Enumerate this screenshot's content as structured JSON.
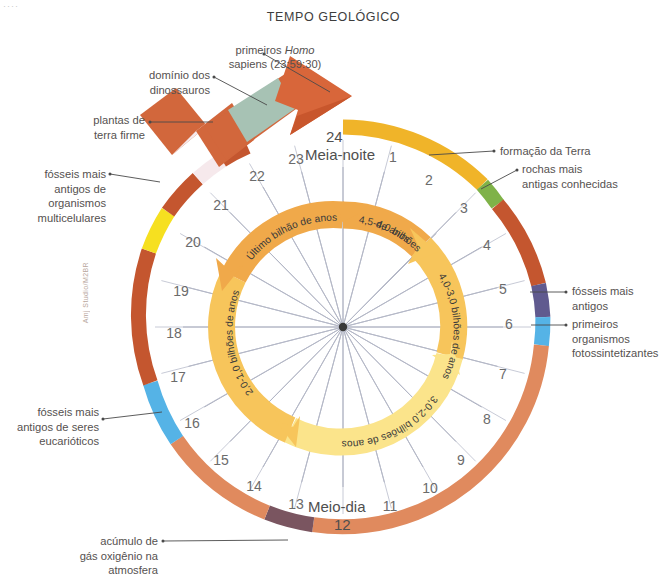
{
  "page": {
    "title": "TEMPO GEOLÓGICO",
    "corner_marks": "····",
    "credit": "Amj Studio/M2BR"
  },
  "colors": {
    "background": "#ffffff",
    "outer_gold": "#f0b429",
    "outer_green": "#7fb248",
    "outer_terracotta": "#c4562f",
    "outer_salmon": "#e08a5e",
    "outer_purple": "#605a8f",
    "outer_skyblue": "#55b3e6",
    "outer_mauve": "#7a5560",
    "outer_yellow": "#f6e020",
    "outer_pale_pink": "#f6e9ec",
    "arrow_sage": "#a7c2b4",
    "inner_pale_yellow": "#fbe48b",
    "inner_gold": "#f7c55b",
    "inner_orange": "#f0a94a",
    "spoke": "#8f93a8",
    "leader": "#4a4a4a",
    "text": "#55514f"
  },
  "clock": {
    "midnight_label": "Meia-noite",
    "midnight_number": "24",
    "noon_label": "Meio-dia",
    "noon_number": "12",
    "hours": [
      "1",
      "2",
      "3",
      "4",
      "5",
      "6",
      "7",
      "8",
      "9",
      "10",
      "11",
      "13",
      "14",
      "15",
      "16",
      "17",
      "18",
      "19",
      "20",
      "21",
      "22",
      "23"
    ]
  },
  "inner_ring_segments": [
    {
      "name": "eon-4.5-4.0",
      "label": "4,5-4,0 bilhões\nde anos",
      "color": "#f0a94a"
    },
    {
      "name": "eon-4.0-3.0",
      "label": "4,0-3,0 bilhões de anos",
      "color": "#f7c55b"
    },
    {
      "name": "eon-3.0-2.0",
      "label": "3,0-2,0 bilhões de anos",
      "color": "#fbe48b"
    },
    {
      "name": "eon-2.0-1.0",
      "label": "2,0-1,0 bilhões de anos",
      "color": "#f7c55b"
    },
    {
      "name": "eon-last-billion",
      "label": "Último bilhão de anos",
      "color": "#f0a94a"
    }
  ],
  "callouts": {
    "homo_sapiens": "primeiros Homo\nsapiens (23:59:30)",
    "homo_sapiens_italic": "Homo",
    "dinossauros": "domínio dos\ndinossauros",
    "plantas": "plantas de\nterra firme",
    "multicelulares": "fósseis mais\nantigos de\norganismos\nmulticelulares",
    "eucarioticos": "fósseis mais\nantigos de seres\neucarióticos",
    "oxigenio": "acúmulo de\ngás oxigênio na\natmosfera",
    "formacao_terra": "formação da Terra",
    "rochas_antigas": "rochas mais\nantigas conhecidas",
    "fosseis_antigos": "fósseis mais\nantigos",
    "fotossintetizantes": "primeiros\norganismos\nfotossintetizantes"
  }
}
